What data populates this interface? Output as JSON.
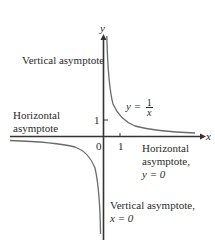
{
  "diagram": {
    "axes": {
      "x_label": "x",
      "y_label": "y",
      "origin_label": "0",
      "x_tick_label": "1",
      "y_tick_label": "1"
    },
    "function_label": {
      "lhs": "y =",
      "numerator": "1",
      "denominator": "x"
    },
    "annotations": {
      "vertical_asymptote_top": "Vertical asymptote",
      "horizontal_asymptote_left_line1": "Horizontal",
      "horizontal_asymptote_left_line2": "asymptote",
      "horizontal_asymptote_right_line1": "Horizontal",
      "horizontal_asymptote_right_line2": "asymptote,",
      "horizontal_asymptote_right_line3": "y = 0",
      "vertical_asymptote_bottom_line1": "Vertical asymptote,",
      "vertical_asymptote_bottom_line2": "x = 0"
    },
    "colors": {
      "axis": "#333333",
      "curve": "#6b6b6b",
      "text": "#2b2b2b"
    }
  }
}
